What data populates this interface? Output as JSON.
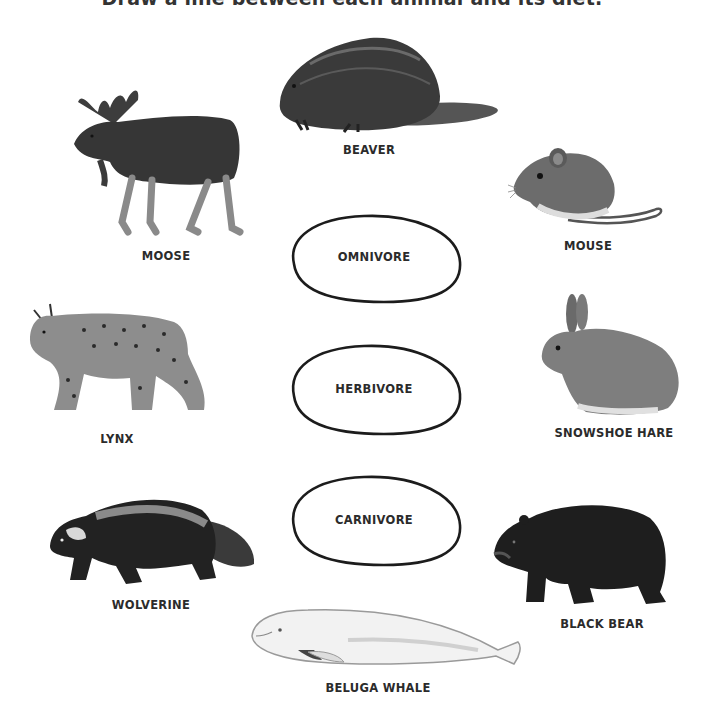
{
  "worksheet": {
    "title": "Draw a line between each animal and its diet.",
    "diet_categories": [
      {
        "label": "OMNIVORE"
      },
      {
        "label": "HERBIVORE"
      },
      {
        "label": "CARNIVORE"
      }
    ],
    "animals": [
      {
        "name": "BEAVER",
        "icon": "beaver-illustration"
      },
      {
        "name": "MOOSE",
        "icon": "moose-illustration"
      },
      {
        "name": "MOUSE",
        "icon": "mouse-illustration"
      },
      {
        "name": "LYNX",
        "icon": "lynx-illustration"
      },
      {
        "name": "SNOWSHOE HARE",
        "icon": "snowshoe-hare-illustration"
      },
      {
        "name": "WOLVERINE",
        "icon": "wolverine-illustration"
      },
      {
        "name": "BLACK BEAR",
        "icon": "black-bear-illustration"
      },
      {
        "name": "BELUGA WHALE",
        "icon": "beluga-whale-illustration"
      }
    ]
  }
}
